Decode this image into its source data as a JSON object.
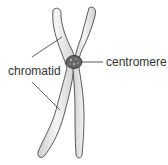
{
  "diagram": {
    "labels": {
      "chromatid": "chromatid",
      "centromere": "centromere"
    },
    "colors": {
      "chromatid_fill": "#e6e6e6",
      "outline": "#333333",
      "centromere_fill": "#555555"
    }
  }
}
